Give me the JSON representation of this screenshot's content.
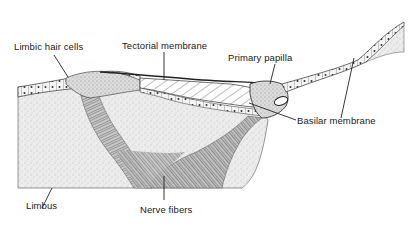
{
  "figure": {
    "type": "anatomical cross-section diagram",
    "colors": {
      "ink": "#2a2a2a",
      "tissue_fill": "#e6e6e6",
      "background": "#ffffff"
    }
  },
  "labels": {
    "limbic_hair_cells": "Limbic  hair cells",
    "tectorial_membrane": "Tectorial membrane",
    "primary_papilla": "Primary  papilla",
    "basilar_membrane": "Basilar membrane",
    "limbus": "Limbus",
    "nerve_fibers": "Nerve fibers"
  }
}
